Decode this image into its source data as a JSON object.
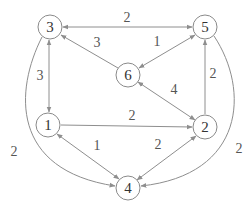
{
  "diagram": {
    "type": "weighted-directed-graph",
    "nodes": [
      {
        "id": "3",
        "label": "3",
        "x": 50,
        "y": 27
      },
      {
        "id": "5",
        "label": "5",
        "x": 205,
        "y": 27
      },
      {
        "id": "6",
        "label": "6",
        "x": 128,
        "y": 75
      },
      {
        "id": "1",
        "label": "1",
        "x": 48,
        "y": 125
      },
      {
        "id": "2",
        "label": "2",
        "x": 205,
        "y": 127
      },
      {
        "id": "4",
        "label": "4",
        "x": 128,
        "y": 188
      }
    ],
    "edges": [
      {
        "from": "3",
        "to": "5",
        "weight": "2",
        "bidirectional": true
      },
      {
        "from": "6",
        "to": "3",
        "weight": "3",
        "bidirectional": false
      },
      {
        "from": "5",
        "to": "6",
        "weight": "1",
        "bidirectional": true
      },
      {
        "from": "3",
        "to": "1",
        "weight": "3",
        "bidirectional": true
      },
      {
        "from": "2",
        "to": "5",
        "weight": "2",
        "bidirectional": false
      },
      {
        "from": "2",
        "to": "6",
        "weight": "4",
        "bidirectional": true
      },
      {
        "from": "1",
        "to": "2",
        "weight": "2",
        "bidirectional": false
      },
      {
        "from": "1",
        "to": "4",
        "weight": "1",
        "bidirectional": true
      },
      {
        "from": "2",
        "to": "4",
        "weight": "2",
        "bidirectional": true
      },
      {
        "from": "3",
        "to": "4",
        "weight": "2",
        "bidirectional": false,
        "curved": true
      },
      {
        "from": "5",
        "to": "4",
        "weight": "2",
        "bidirectional": false,
        "curved": true
      }
    ]
  },
  "labels": {
    "n3": "3",
    "n5": "5",
    "n6": "6",
    "n1": "1",
    "n2": "2",
    "n4": "4",
    "w35": "2",
    "w63": "3",
    "w56": "1",
    "w31": "3",
    "w25": "2",
    "w26": "4",
    "w12": "2",
    "w14": "1",
    "w24": "2",
    "w34": "2",
    "w54": "2"
  },
  "colors": {
    "edge": "#8e8e8e",
    "node_stroke": "#8a8a8a",
    "text": "#333333"
  }
}
